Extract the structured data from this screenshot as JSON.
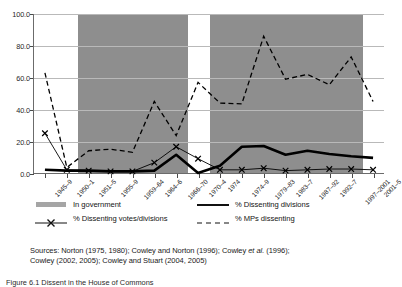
{
  "chart_data": {
    "type": "line",
    "title": "",
    "xlabel": "",
    "ylabel": "",
    "ylim": [
      0.0,
      100.0
    ],
    "ytick_labels": [
      "100.0",
      "80.0",
      "60.0",
      "40.0",
      "20.0",
      "0.0"
    ],
    "ytick_values": [
      100.0,
      80.0,
      60.0,
      40.0,
      20.0,
      0.0
    ],
    "grid": true,
    "legend_position": "below-axis",
    "categories": [
      "1945–9",
      "1950–1",
      "1951–5",
      "1955–9",
      "1959–64",
      "1964–6",
      "1966–70",
      "1970–4",
      "1974",
      "1974–9",
      "1979–83",
      "1983–7",
      "1987–92",
      "1992–7",
      "1997–2001",
      "2001–5"
    ],
    "series": [
      {
        "name": "% Dissenting divisions",
        "style": "thick-solid",
        "color": "#000000",
        "values": [
          2.0,
          1.5,
          1.5,
          1.0,
          1.0,
          1.5,
          11.5,
          0.0,
          4.5,
          16.5,
          17.0,
          11.5,
          14.0,
          12.0,
          10.5,
          9.5
        ]
      },
      {
        "name": "% Dissenting votes/divisions",
        "style": "thin-solid-x-markers",
        "color": "#000000",
        "values": [
          25.0,
          2.0,
          1.5,
          1.0,
          1.0,
          6.5,
          16.5,
          9.0,
          2.0,
          2.0,
          3.0,
          1.5,
          2.0,
          2.5,
          2.5,
          2.0
        ]
      },
      {
        "name": "% MPs dissenting",
        "style": "dashed",
        "color": "#000000",
        "values": [
          63.0,
          3.5,
          14.0,
          15.0,
          13.0,
          45.0,
          23.5,
          57.0,
          44.0,
          43.5,
          86.0,
          59.0,
          62.0,
          55.5,
          73.0,
          45.0
        ]
      }
    ],
    "shaded_bands": {
      "label": "In government",
      "color": "#8e8e8e",
      "ranges": [
        [
          2,
          6
        ],
        [
          8,
          9
        ],
        [
          10,
          14
        ]
      ]
    }
  },
  "legend": {
    "rows": [
      [
        {
          "key": "swatch-grey",
          "label": "In government"
        },
        {
          "key": "line-thick-solid",
          "label": "% Dissenting divisions"
        }
      ],
      [
        {
          "key": "line-x-marker",
          "label": "% Dissenting votes/divisions"
        },
        {
          "key": "line-dashed",
          "label": "% MPs dissenting"
        }
      ]
    ]
  },
  "sources": {
    "line1_prefix": "Sources: Norton (1975, 1980); Cowley and Norton (1996); Cowley ",
    "line1_italic": "et al.",
    "line1_suffix": " (1996);",
    "line2": "Cowley (2002, 2005); Cowley and Stuart (2004, 2005)"
  },
  "caption": {
    "text": "Figure 6.1  Dissent in the House of Commons"
  }
}
